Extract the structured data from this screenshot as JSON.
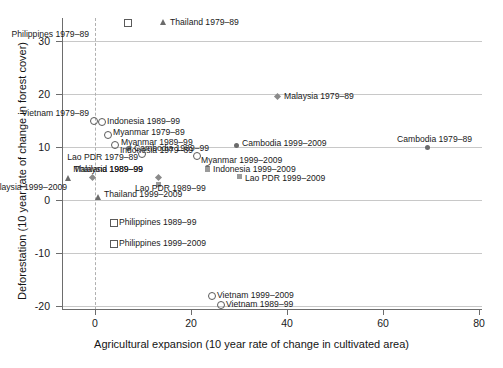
{
  "chart_data": {
    "type": "scatter",
    "title": "",
    "xlabel": "Agricultural expansion (10 year rate of change in cultivated area)",
    "ylabel": "Deforestation (10 year rate of change in forest cover)",
    "xlim": [
      -9,
      82
    ],
    "ylim": [
      -23,
      34
    ],
    "xticks": [
      0,
      20,
      40,
      60,
      80
    ],
    "yticks": [
      30,
      20,
      10,
      0,
      -10,
      -20
    ],
    "xtick_labels": [
      "0",
      "20",
      "40",
      "60",
      "80"
    ],
    "ytick_labels": [
      "30",
      "20",
      "10",
      "0",
      "-10",
      "-20"
    ],
    "grid": "horizontal",
    "reference_line_x": 0,
    "legend": "none (points labelled in place)",
    "points": [
      {
        "label": "Philippines 1979–89",
        "x": 6.7,
        "y": 33.2,
        "marker": "square",
        "anchor": "below-left",
        "px": 127,
        "py": 22,
        "lx": 89,
        "ly": 34
      },
      {
        "label": "Thailand 1979–89",
        "x": 14.2,
        "y": 33.2,
        "marker": "triangle",
        "anchor": "right",
        "px": 163,
        "py": 22,
        "lx": 170,
        "ly": 22
      },
      {
        "label": "Malaysia 1979–89",
        "x": 37.9,
        "y": 19.6,
        "marker": "diamond",
        "anchor": "right",
        "px": 277,
        "py": 96,
        "lx": 284,
        "ly": 96
      },
      {
        "label": "Vietnam 1979–89",
        "x": -1.0,
        "y": 15.3,
        "marker": "circle",
        "anchor": "above-left",
        "px": 93,
        "py": 120,
        "lx": 89,
        "ly": 113
      },
      {
        "label": "Indonesia 1989–99",
        "x": 2.2,
        "y": 15.2,
        "marker": "circle",
        "anchor": "right",
        "px": 101,
        "py": 121,
        "lx": 107,
        "ly": 121
      },
      {
        "label": "Myanmar 1979–89",
        "x": 3.4,
        "y": 12.6,
        "marker": "circle",
        "anchor": "right",
        "px": 107,
        "py": 134,
        "lx": 113,
        "ly": 132
      },
      {
        "label": "Myanmar 1989–99",
        "x": 4.9,
        "y": 10.8,
        "marker": "circle",
        "anchor": "right",
        "px": 114,
        "py": 144,
        "lx": 121,
        "ly": 142
      },
      {
        "label": "Cambodia 1989–99",
        "x": 7.0,
        "y": 10.0,
        "marker": "fcircle",
        "anchor": "right",
        "px": 128,
        "py": 148,
        "lx": 134,
        "ly": 148
      },
      {
        "label": "Cambodia 1999–2009",
        "x": 29.3,
        "y": 10.7,
        "marker": "fcircle",
        "anchor": "right",
        "px": 236,
        "py": 145,
        "lx": 242,
        "ly": 143
      },
      {
        "label": "Indonesia 1979–89",
        "x": 21.2,
        "y": 8.5,
        "marker": "circle",
        "anchor": "left",
        "px": 196,
        "py": 155,
        "lx": 193,
        "ly": 150
      },
      {
        "label": "Lao PDR 1979–89",
        "x": 9.6,
        "y": 8.9,
        "marker": "circle",
        "anchor": "left",
        "px": 141,
        "py": 153,
        "lx": 138,
        "ly": 157
      },
      {
        "label": "Myanmar 1999–2009",
        "x": 23.5,
        "y": 6.3,
        "marker": "fcircle",
        "anchor": "right",
        "px": 207,
        "py": 167,
        "lx": 201,
        "ly": 160
      },
      {
        "label": "Indonesia 1999–2009",
        "x": 23.5,
        "y": 5.6,
        "marker": "fsquare",
        "anchor": "right",
        "px": 207,
        "py": 169,
        "lx": 213,
        "ly": 169
      },
      {
        "label": "Lao PDR 1999–2009",
        "x": 30.0,
        "y": 4.4,
        "marker": "fsquare",
        "anchor": "right",
        "px": 239,
        "py": 176,
        "lx": 245,
        "ly": 178
      },
      {
        "label": "Thailand 1989–99",
        "x": -5.7,
        "y": 4.2,
        "marker": "triangle",
        "anchor": "above-right",
        "px": 68,
        "py": 178,
        "lx": 74,
        "ly": 169
      },
      {
        "label": "Malaysia 1999–2009",
        "x": -0.6,
        "y": 4.2,
        "marker": "diamond",
        "anchor": "below-left",
        "px": 92,
        "py": 177,
        "lx": 67,
        "ly": 187
      },
      {
        "label": "Malaysia 1989–99",
        "x": 13.1,
        "y": 4.2,
        "marker": "diamond",
        "anchor": "above-left",
        "px": 158,
        "py": 177,
        "lx": 143,
        "ly": 169
      },
      {
        "label": "Lao PDR 1989–99",
        "x": 13.1,
        "y": 2.7,
        "marker": "fsquare",
        "anchor": "below",
        "px": 158,
        "py": 184,
        "lx": 135,
        "ly": 188
      },
      {
        "label": "Thailand 1999–2009",
        "x": 0.7,
        "y": 0.5,
        "marker": "triangle",
        "anchor": "right",
        "px": 98,
        "py": 197,
        "lx": 104,
        "ly": 194
      },
      {
        "label": "Cambodia 1979–89",
        "x": 69.3,
        "y": 9.9,
        "marker": "fcircle",
        "anchor": "above",
        "px": 427,
        "py": 147,
        "lx": 397,
        "ly": 139
      },
      {
        "label": "Philippines 1989–99",
        "x": 3.7,
        "y": -4.2,
        "marker": "square",
        "anchor": "right",
        "px": 113,
        "py": 222,
        "lx": 119,
        "ly": 222
      },
      {
        "label": "Philippines 1999–2009",
        "x": 3.7,
        "y": -8.1,
        "marker": "square",
        "anchor": "right",
        "px": 113,
        "py": 243,
        "lx": 119,
        "ly": 243
      },
      {
        "label": "Vietnam 1999–2009",
        "x": 24.2,
        "y": -18.5,
        "marker": "circle",
        "anchor": "right",
        "px": 211,
        "py": 295,
        "lx": 217,
        "ly": 295
      },
      {
        "label": "Vietnam 1989–99",
        "x": 26.1,
        "y": -20.0,
        "marker": "circle",
        "anchor": "right",
        "px": 220,
        "py": 304,
        "lx": 226,
        "ly": 304
      }
    ]
  }
}
